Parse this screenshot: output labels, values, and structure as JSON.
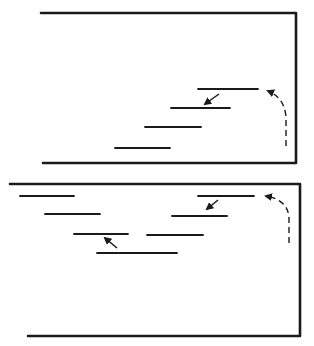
{
  "diagram": {
    "stroke_color": "#1a1a1a",
    "background": "#ffffff",
    "panels": [
      {
        "id": "top-panel",
        "frame": {
          "top": [
            [
              41,
              13
            ],
            [
              296,
              13
            ]
          ],
          "right": [
            [
              296,
              13
            ],
            [
              296,
              163
            ]
          ],
          "bottom": [
            [
              43,
              163
            ],
            [
              296,
              163
            ]
          ]
        },
        "lines": [
          {
            "x1": 198,
            "x2": 258,
            "y": 89
          },
          {
            "x1": 171,
            "x2": 230,
            "y": 108
          },
          {
            "x1": 145,
            "x2": 201,
            "y": 127
          },
          {
            "x1": 115,
            "x2": 170,
            "y": 148
          }
        ],
        "arrows": [
          {
            "from": [
              219,
              94
            ],
            "to": [
              205,
              104
            ]
          }
        ],
        "dashed_return": {
          "path": "M286,146 L286,118 Q285,98 268,91",
          "arrow_tip": [
            267,
            91
          ]
        }
      },
      {
        "id": "bottom-panel",
        "frame": {
          "top": [
            [
              10,
              184
            ],
            [
              300,
              184
            ]
          ],
          "right": [
            [
              300,
              184
            ],
            [
              300,
              336
            ]
          ],
          "bottom": [
            [
              28,
              336
            ],
            [
              300,
              336
            ]
          ]
        },
        "lines": [
          {
            "x1": 20,
            "x2": 74,
            "y": 196
          },
          {
            "x1": 45,
            "x2": 100,
            "y": 214
          },
          {
            "x1": 74,
            "x2": 128,
            "y": 234
          },
          {
            "x1": 97,
            "x2": 177,
            "y": 253
          },
          {
            "x1": 198,
            "x2": 254,
            "y": 196
          },
          {
            "x1": 172,
            "x2": 227,
            "y": 216
          },
          {
            "x1": 147,
            "x2": 203,
            "y": 235
          }
        ],
        "arrows": [
          {
            "from": [
              218,
              200
            ],
            "to": [
              207,
              209
            ]
          },
          {
            "from": [
              117,
              248
            ],
            "to": [
              105,
              238
            ]
          }
        ],
        "dashed_return": {
          "path": "M289,243 L289,218 Q288,200 266,196",
          "arrow_tip": [
            265,
            196
          ]
        }
      }
    ]
  }
}
